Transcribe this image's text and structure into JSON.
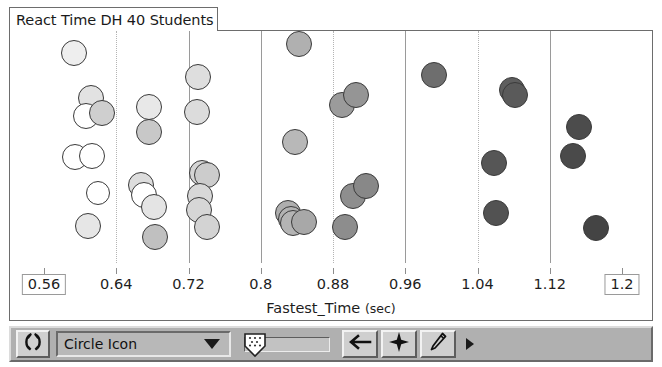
{
  "window": {
    "title": "React Time DH 40 Students"
  },
  "chart_data": {
    "type": "scatter",
    "title": "React Time DH 40 Students",
    "xlabel": "Fastest_Time",
    "xunit": "(sec)",
    "ylabel": "",
    "xlim": [
      0.56,
      1.2
    ],
    "xticks": [
      0.56,
      0.64,
      0.72,
      0.8,
      0.88,
      0.96,
      1.04,
      1.12,
      1.2
    ],
    "xticklabels": [
      "0.56",
      "0.64",
      "0.72",
      "0.8",
      "0.88",
      "0.96",
      "1.04",
      "1.12",
      "1.2"
    ],
    "axis_min_label": "0.56",
    "axis_max_label": "1.2",
    "grid": true,
    "gridlines": [
      {
        "value": 0.64,
        "style": "dotted"
      },
      {
        "value": 0.72,
        "style": "solid"
      },
      {
        "value": 0.8,
        "style": "solid"
      },
      {
        "value": 0.88,
        "style": "dotted"
      },
      {
        "value": 0.96,
        "style": "solid"
      },
      {
        "value": 1.04,
        "style": "dotted"
      },
      {
        "value": 1.12,
        "style": "solid"
      }
    ],
    "legend": null,
    "marker": "circle",
    "note": "Dot fill darkens with increasing Fastest_Time (color-coded gradient from white to dark gray).",
    "points": [
      {
        "x": 0.593,
        "y": 0.905,
        "r": 13,
        "fill": "#eeeeee"
      },
      {
        "x": 0.612,
        "y": 0.712,
        "r": 13,
        "fill": "#e2e2e2"
      },
      {
        "x": 0.606,
        "y": 0.632,
        "r": 13,
        "fill": "#ffffff"
      },
      {
        "x": 0.624,
        "y": 0.645,
        "r": 13,
        "fill": "#cfcfcf"
      },
      {
        "x": 0.594,
        "y": 0.455,
        "r": 13,
        "fill": "#ffffff"
      },
      {
        "x": 0.613,
        "y": 0.46,
        "r": 13,
        "fill": "#ffffff"
      },
      {
        "x": 0.62,
        "y": 0.3,
        "r": 12,
        "fill": "#ffffff"
      },
      {
        "x": 0.609,
        "y": 0.16,
        "r": 13,
        "fill": "#e6e6e6"
      },
      {
        "x": 0.676,
        "y": 0.672,
        "r": 13,
        "fill": "#e8e8e8"
      },
      {
        "x": 0.676,
        "y": 0.565,
        "r": 13,
        "fill": "#c8c8c8"
      },
      {
        "x": 0.667,
        "y": 0.335,
        "r": 13,
        "fill": "#dddddd"
      },
      {
        "x": 0.671,
        "y": 0.295,
        "r": 13,
        "fill": "#ffffff"
      },
      {
        "x": 0.682,
        "y": 0.24,
        "r": 13,
        "fill": "#e4e4e4"
      },
      {
        "x": 0.683,
        "y": 0.11,
        "r": 13,
        "fill": "#c0c0c0"
      },
      {
        "x": 0.731,
        "y": 0.8,
        "r": 13,
        "fill": "#dedede"
      },
      {
        "x": 0.729,
        "y": 0.65,
        "r": 13,
        "fill": "#dcdcdc"
      },
      {
        "x": 0.735,
        "y": 0.39,
        "r": 13,
        "fill": "#d5d5d5"
      },
      {
        "x": 0.741,
        "y": 0.378,
        "r": 13,
        "fill": "#cccccc"
      },
      {
        "x": 0.733,
        "y": 0.288,
        "r": 13,
        "fill": "#d8d8d8"
      },
      {
        "x": 0.732,
        "y": 0.23,
        "r": 13,
        "fill": "#d6d6d6"
      },
      {
        "x": 0.741,
        "y": 0.155,
        "r": 13,
        "fill": "#d3d3d3"
      },
      {
        "x": 0.842,
        "y": 0.945,
        "r": 13,
        "fill": "#b0b0b0"
      },
      {
        "x": 0.838,
        "y": 0.52,
        "r": 13,
        "fill": "#b8b8b8"
      },
      {
        "x": 0.83,
        "y": 0.215,
        "r": 13,
        "fill": "#aeaeae"
      },
      {
        "x": 0.833,
        "y": 0.19,
        "r": 13,
        "fill": "#b2b2b2"
      },
      {
        "x": 0.836,
        "y": 0.172,
        "r": 13,
        "fill": "#b4b4b4"
      },
      {
        "x": 0.848,
        "y": 0.175,
        "r": 13,
        "fill": "#a8a8a8"
      },
      {
        "x": 0.89,
        "y": 0.68,
        "r": 13,
        "fill": "#9b9b9b"
      },
      {
        "x": 0.906,
        "y": 0.725,
        "r": 13,
        "fill": "#959595"
      },
      {
        "x": 0.902,
        "y": 0.29,
        "r": 13,
        "fill": "#8e8e8e"
      },
      {
        "x": 0.916,
        "y": 0.33,
        "r": 13,
        "fill": "#888888"
      },
      {
        "x": 0.893,
        "y": 0.155,
        "r": 13,
        "fill": "#8d8d8d"
      },
      {
        "x": 0.992,
        "y": 0.81,
        "r": 13,
        "fill": "#6e6e6e"
      },
      {
        "x": 1.078,
        "y": 0.745,
        "r": 13,
        "fill": "#5e5e5e"
      },
      {
        "x": 1.081,
        "y": 0.725,
        "r": 13,
        "fill": "#5a5a5a"
      },
      {
        "x": 1.058,
        "y": 0.43,
        "r": 13,
        "fill": "#565656"
      },
      {
        "x": 1.061,
        "y": 0.215,
        "r": 13,
        "fill": "#525252"
      },
      {
        "x": 1.152,
        "y": 0.585,
        "r": 13,
        "fill": "#4c4c4c"
      },
      {
        "x": 1.146,
        "y": 0.46,
        "r": 13,
        "fill": "#4a4a4a"
      },
      {
        "x": 1.171,
        "y": 0.15,
        "r": 13,
        "fill": "#444444"
      }
    ]
  },
  "toolbar": {
    "rotate_button_label": "( )",
    "dropdown_value": "Circle Icon",
    "dropdown_options": [
      "Circle Icon"
    ],
    "slider_value": "",
    "buttons": [
      {
        "name": "back-arrow",
        "glyph": "←"
      },
      {
        "name": "move-crosshair",
        "glyph": "✦"
      },
      {
        "name": "pencil",
        "glyph": "✎"
      }
    ],
    "more_label": ""
  }
}
